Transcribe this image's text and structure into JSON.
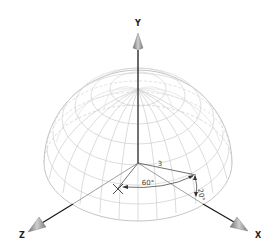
{
  "diagram": {
    "title": "",
    "axes": [
      {
        "name": "Y",
        "label": "Y"
      },
      {
        "name": "Z",
        "label": "Z"
      },
      {
        "name": "X",
        "label": "X"
      }
    ],
    "shape": "hemisphere-wireframe",
    "annotations": {
      "radius": "3",
      "azimuth_angle": "60°",
      "elevation_angle": "20°"
    },
    "colors": {
      "wireframe": "#c8c8c8",
      "axis": "#1a1a1a",
      "arrowhead": "#9a9a9a",
      "dimension": "#444444"
    }
  }
}
